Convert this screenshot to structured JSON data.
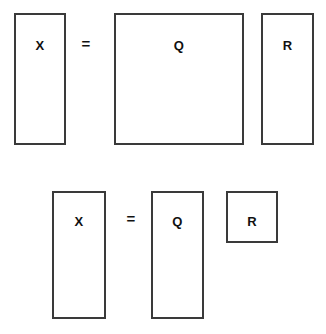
{
  "diagram": {
    "type": "matrix-factorization-illustration",
    "background_color": "#ffffff",
    "stroke_color": "#3a3a3a",
    "text_color": "#111111",
    "rows": [
      {
        "id": "full-qr",
        "description": "Full QR factorization: tall X equals square Q times tall R",
        "operator": "=",
        "blocks": [
          {
            "id": "x-full",
            "label": "X",
            "shape": "tall-rectangle",
            "width": 52,
            "height": 132
          },
          {
            "id": "q-full",
            "label": "Q",
            "shape": "square",
            "width": 130,
            "height": 132
          },
          {
            "id": "r-full",
            "label": "R",
            "shape": "tall-rectangle",
            "width": 53,
            "height": 132
          }
        ]
      },
      {
        "id": "reduced-qr",
        "description": "Reduced QR factorization: tall X equals tall Q times square R",
        "operator": "=",
        "blocks": [
          {
            "id": "x-thin",
            "label": "X",
            "shape": "tall-rectangle",
            "width": 54,
            "height": 128
          },
          {
            "id": "q-thin",
            "label": "Q",
            "shape": "tall-rectangle",
            "width": 53,
            "height": 128
          },
          {
            "id": "r-thin",
            "label": "R",
            "shape": "square",
            "width": 52,
            "height": 52
          }
        ]
      }
    ]
  }
}
